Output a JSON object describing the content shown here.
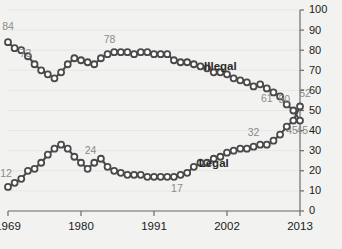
{
  "chart_data": {
    "type": "line",
    "title": "",
    "subtitle": "",
    "xlabel": "",
    "ylabel": "",
    "xlim": [
      1969,
      2013
    ],
    "ylim": [
      0,
      100
    ],
    "grid": true,
    "legend_position": "inline",
    "y_ticks": [
      100,
      90,
      80,
      70,
      60,
      50,
      40,
      30,
      20,
      10,
      0
    ],
    "y_axis_side": "right",
    "x_ticks": [
      1969,
      1980,
      1991,
      2002,
      2013
    ],
    "series": [
      {
        "name": "Illegal",
        "name_x": 2001,
        "name_y": 70,
        "x": [
          1969,
          1970,
          1971,
          1972,
          1973,
          1974,
          1975,
          1976,
          1977,
          1978,
          1979,
          1980,
          1981,
          1982,
          1983,
          1984,
          1985,
          1986,
          1987,
          1988,
          1989,
          1990,
          1991,
          1992,
          1993,
          1994,
          1995,
          1996,
          1997,
          1998,
          1999,
          2000,
          2001,
          2002,
          2003,
          2004,
          2005,
          2006,
          2007,
          2008,
          2009,
          2010,
          2011,
          2012,
          2013
        ],
        "values": [
          84,
          81,
          80,
          77,
          73,
          70,
          68,
          66,
          69,
          73,
          76,
          75,
          74,
          73,
          76,
          78,
          79,
          79,
          79,
          78,
          79,
          79,
          78,
          78,
          78,
          75,
          74,
          74,
          73,
          72,
          71,
          69,
          69,
          68,
          66,
          65,
          64,
          62,
          63,
          61,
          59,
          57,
          53,
          50,
          45
        ],
        "labeled_points": [
          {
            "x": 1969,
            "value": 84,
            "label": "84",
            "dx": 0,
            "dy": -12
          },
          {
            "x": 1973,
            "value": 73,
            "label": "73",
            "dx": -9,
            "dy": -7
          },
          {
            "x": 1984,
            "value": 78,
            "label": "78",
            "dx": 2,
            "dy": -11
          },
          {
            "x": 2008,
            "value": 61,
            "label": "61",
            "dx": 0,
            "dy": 14
          },
          {
            "x": 2012,
            "value": 50,
            "label": "50",
            "dx": -9,
            "dy": -8
          },
          {
            "x": 2013,
            "value": 45,
            "label": "45",
            "dx": -8,
            "dy": 13
          }
        ]
      },
      {
        "name": "Legal",
        "name_x": 2000,
        "name_y": 22,
        "x": [
          1969,
          1970,
          1971,
          1972,
          1973,
          1974,
          1975,
          1976,
          1977,
          1978,
          1979,
          1980,
          1981,
          1982,
          1983,
          1984,
          1985,
          1986,
          1987,
          1988,
          1989,
          1990,
          1991,
          1992,
          1993,
          1994,
          1995,
          1996,
          1997,
          1998,
          1999,
          2000,
          2001,
          2002,
          2003,
          2004,
          2005,
          2006,
          2007,
          2008,
          2009,
          2010,
          2011,
          2012,
          2013
        ],
        "values": [
          12,
          14,
          16,
          20,
          21,
          24,
          28,
          31,
          33,
          31,
          27,
          24,
          21,
          24,
          26,
          22,
          20,
          19,
          18,
          18,
          18,
          17,
          17,
          17,
          17,
          17,
          18,
          19,
          22,
          24,
          24,
          26,
          27,
          29,
          30,
          31,
          31,
          32,
          33,
          33,
          35,
          38,
          42,
          45,
          52
        ],
        "labeled_points": [
          {
            "x": 1969,
            "value": 12,
            "label": "12",
            "dx": -2,
            "dy": -10
          },
          {
            "x": 1981,
            "value": 24,
            "label": "24",
            "dx": 3,
            "dy": -9
          },
          {
            "x": 1994,
            "value": 17,
            "label": "17",
            "dx": 3,
            "dy": 15
          },
          {
            "x": 2006,
            "value": 32,
            "label": "32",
            "dx": 0,
            "dy": -11
          },
          {
            "x": 2012,
            "value": 45,
            "label": "45",
            "dx": 9,
            "dy": 13
          },
          {
            "x": 2013,
            "value": 52,
            "label": "52",
            "dx": 5,
            "dy": -9
          }
        ]
      }
    ],
    "colors": {
      "background": "#f2f2f0",
      "line": "#4a4a4a",
      "marker_fill": "#ffffff",
      "axis": "#6b6b6b",
      "gridline": "#e6e6e4",
      "tick_text": "#1a1a1a",
      "point_label": "#8a8a8a",
      "series_label": "#2b2b2b"
    }
  }
}
